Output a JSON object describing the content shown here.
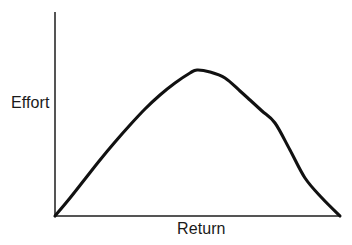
{
  "figure": {
    "background_color": "#ffffff",
    "width": 352,
    "height": 245
  },
  "labels": {
    "y_axis": "Effort",
    "x_axis": "Return"
  },
  "chart_data": {
    "type": "line",
    "title": "",
    "subtitle": "",
    "xlabel": "Return",
    "ylabel": "Effort",
    "grid": false,
    "legend": false,
    "legend_position": "none",
    "axis_style": {
      "color": "#555555",
      "width": 1.3,
      "x_axis_from": [
        55,
        216
      ],
      "x_axis_to": [
        340,
        216
      ],
      "y_axis_from": [
        55,
        12
      ],
      "y_axis_to": [
        55,
        216
      ],
      "ticks": false,
      "tick_labels": false
    },
    "xlim": [
      0,
      1
    ],
    "ylim": [
      0,
      1
    ],
    "series": [
      {
        "name": "Effort vs Return",
        "color": "#111111",
        "width": 3.1,
        "points_px": [
          [
            55,
            216
          ],
          [
            70,
            198
          ],
          [
            85,
            179
          ],
          [
            100,
            160
          ],
          [
            115,
            142
          ],
          [
            130,
            125
          ],
          [
            145,
            109
          ],
          [
            160,
            95
          ],
          [
            175,
            83
          ],
          [
            190,
            73
          ],
          [
            197,
            70
          ],
          [
            210,
            72
          ],
          [
            225,
            78
          ],
          [
            240,
            91
          ],
          [
            250,
            100
          ],
          [
            262,
            111
          ],
          [
            275,
            123
          ],
          [
            290,
            150
          ],
          [
            305,
            178
          ],
          [
            322,
            198
          ],
          [
            340,
            216
          ]
        ],
        "x": [
          0.0,
          0.05,
          0.11,
          0.16,
          0.21,
          0.26,
          0.32,
          0.37,
          0.42,
          0.47,
          0.5,
          0.54,
          0.6,
          0.65,
          0.68,
          0.73,
          0.77,
          0.82,
          0.88,
          0.94,
          1.0
        ],
        "y": [
          0.0,
          0.09,
          0.18,
          0.27,
          0.36,
          0.45,
          0.52,
          0.59,
          0.65,
          0.7,
          0.72,
          0.71,
          0.68,
          0.61,
          0.57,
          0.51,
          0.46,
          0.32,
          0.19,
          0.09,
          0.0
        ]
      }
    ],
    "annotations": [],
    "peak": {
      "x_px": 197,
      "y_px": 70,
      "x_norm": 0.5,
      "y_norm": 0.72
    }
  }
}
